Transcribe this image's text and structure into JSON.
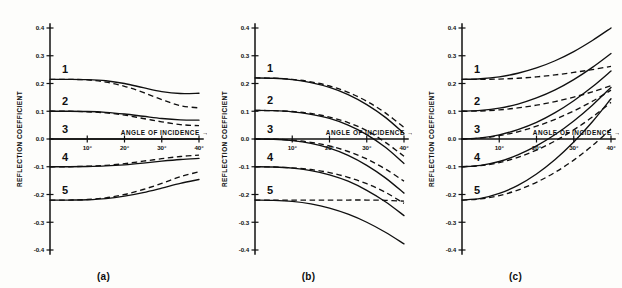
{
  "figure": {
    "panels": [
      {
        "caption": "(a)",
        "xlabel": "ANGLE OF INCIDENCE",
        "xlabel_arrow": "→",
        "ylabel": "REFLECTION COEFFICIENT",
        "curve_labels": [
          "1",
          "2",
          "3",
          "4",
          "5"
        ]
      },
      {
        "caption": "(b)",
        "xlabel": "ANGLE OF INCIDENCE",
        "xlabel_arrow": "→",
        "ylabel": "REFLECTION COEFFICIENT",
        "curve_labels": [
          "1",
          "2",
          "3",
          "4",
          "5"
        ]
      },
      {
        "caption": "(c)",
        "xlabel": "ANGLE OF INCIDENCE",
        "xlabel_arrow": "→",
        "ylabel": "REFLECTION COEFFICIENT",
        "curve_labels": [
          "1",
          "2",
          "3",
          "4",
          "5"
        ]
      }
    ],
    "yticks": [
      "0.4",
      "0.3",
      "0.2",
      "0.1",
      "0.0",
      "-0.1",
      "-0.2",
      "-0.3",
      "-0.4"
    ],
    "xticks": [
      "10°",
      "20°",
      "30°",
      "40°"
    ]
  },
  "chart_data": [
    {
      "type": "line",
      "title": "(a)",
      "xlabel": "ANGLE OF INCIDENCE",
      "ylabel": "REFLECTION COEFFICIENT",
      "xlim": [
        0,
        40
      ],
      "ylim": [
        -0.4,
        0.4
      ],
      "xticks": [
        10,
        20,
        30,
        40
      ],
      "yticks": [
        -0.4,
        -0.3,
        -0.2,
        -0.1,
        0.0,
        0.1,
        0.2,
        0.3,
        0.4
      ],
      "grid": false,
      "legend": "none",
      "x": [
        0,
        5,
        10,
        15,
        20,
        25,
        30,
        35,
        40
      ],
      "series": [
        {
          "name": "1 solid",
          "label": "1",
          "style": "solid",
          "values": [
            0.215,
            0.215,
            0.214,
            0.21,
            0.2,
            0.185,
            0.171,
            0.164,
            0.165
          ]
        },
        {
          "name": "1 dashed",
          "label": "1",
          "style": "dashed",
          "values": [
            0.215,
            0.215,
            0.213,
            0.205,
            0.19,
            0.168,
            0.142,
            0.12,
            0.112
          ]
        },
        {
          "name": "2 solid",
          "label": "2",
          "style": "solid",
          "values": [
            0.1,
            0.1,
            0.099,
            0.096,
            0.09,
            0.082,
            0.074,
            0.069,
            0.068
          ]
        },
        {
          "name": "2 dashed",
          "label": "2",
          "style": "dashed",
          "values": [
            0.1,
            0.1,
            0.098,
            0.094,
            0.086,
            0.074,
            0.062,
            0.052,
            0.048
          ]
        },
        {
          "name": "3 solid",
          "label": "3",
          "style": "solid",
          "values": [
            0.0,
            0.0,
            0.0,
            0.0,
            0.0,
            0.0,
            0.0,
            0.0,
            0.0
          ]
        },
        {
          "name": "4 solid",
          "label": "4",
          "style": "solid",
          "values": [
            -0.1,
            -0.1,
            -0.099,
            -0.097,
            -0.093,
            -0.087,
            -0.08,
            -0.074,
            -0.07
          ]
        },
        {
          "name": "4 dashed",
          "label": "4",
          "style": "dashed",
          "values": [
            -0.1,
            -0.1,
            -0.098,
            -0.095,
            -0.089,
            -0.08,
            -0.071,
            -0.063,
            -0.058
          ]
        },
        {
          "name": "5 solid",
          "label": "5",
          "style": "solid",
          "values": [
            -0.22,
            -0.22,
            -0.219,
            -0.215,
            -0.206,
            -0.193,
            -0.177,
            -0.16,
            -0.146
          ]
        },
        {
          "name": "5 dashed",
          "label": "5",
          "style": "dashed",
          "values": [
            -0.22,
            -0.22,
            -0.218,
            -0.212,
            -0.2,
            -0.182,
            -0.16,
            -0.136,
            -0.118
          ]
        }
      ]
    },
    {
      "type": "line",
      "title": "(b)",
      "xlabel": "ANGLE OF INCIDENCE",
      "ylabel": "REFLECTION COEFFICIENT",
      "xlim": [
        0,
        40
      ],
      "ylim": [
        -0.4,
        0.4
      ],
      "xticks": [
        10,
        20,
        30,
        40
      ],
      "yticks": [
        -0.4,
        -0.3,
        -0.2,
        -0.1,
        0.0,
        0.1,
        0.2,
        0.3,
        0.4
      ],
      "grid": false,
      "legend": "none",
      "x": [
        0,
        5,
        10,
        15,
        20,
        25,
        30,
        35,
        40
      ],
      "series": [
        {
          "name": "1 solid",
          "label": "1",
          "style": "solid",
          "values": [
            0.22,
            0.219,
            0.214,
            0.203,
            0.186,
            0.16,
            0.124,
            0.078,
            0.02
          ]
        },
        {
          "name": "1 dashed",
          "label": "1",
          "style": "dashed",
          "values": [
            0.22,
            0.219,
            0.215,
            0.206,
            0.191,
            0.168,
            0.136,
            0.094,
            0.042
          ]
        },
        {
          "name": "2 solid",
          "label": "2",
          "style": "solid",
          "values": [
            0.103,
            0.102,
            0.098,
            0.089,
            0.074,
            0.05,
            0.016,
            -0.03,
            -0.088
          ]
        },
        {
          "name": "2 dashed",
          "label": "2",
          "style": "dashed",
          "values": [
            0.103,
            0.102,
            0.099,
            0.092,
            0.079,
            0.059,
            0.03,
            -0.012,
            -0.062
          ]
        },
        {
          "name": "3 solid",
          "label": "3",
          "style": "solid",
          "values": [
            0.0,
            -0.001,
            -0.006,
            -0.016,
            -0.033,
            -0.059,
            -0.095,
            -0.14,
            -0.195
          ]
        },
        {
          "name": "3 dashed",
          "label": "3",
          "style": "dashed",
          "values": [
            0.0,
            -0.001,
            -0.004,
            -0.012,
            -0.025,
            -0.045,
            -0.072,
            -0.108,
            -0.152
          ]
        },
        {
          "name": "4 solid",
          "label": "4",
          "style": "solid",
          "values": [
            -0.1,
            -0.101,
            -0.105,
            -0.114,
            -0.129,
            -0.152,
            -0.185,
            -0.226,
            -0.276
          ]
        },
        {
          "name": "4 dashed",
          "label": "4",
          "style": "dashed",
          "values": [
            -0.1,
            -0.101,
            -0.104,
            -0.11,
            -0.121,
            -0.138,
            -0.161,
            -0.192,
            -0.232
          ]
        },
        {
          "name": "5 solid",
          "label": "5",
          "style": "solid",
          "values": [
            -0.22,
            -0.221,
            -0.225,
            -0.234,
            -0.249,
            -0.271,
            -0.3,
            -0.336,
            -0.378
          ]
        },
        {
          "name": "5 dashed",
          "label": "5",
          "style": "dashed",
          "values": [
            -0.22,
            -0.22,
            -0.22,
            -0.22,
            -0.22,
            -0.22,
            -0.22,
            -0.221,
            -0.224
          ]
        }
      ]
    },
    {
      "type": "line",
      "title": "(c)",
      "xlabel": "ANGLE OF INCIDENCE",
      "ylabel": "REFLECTION COEFFICIENT",
      "xlim": [
        0,
        40
      ],
      "ylim": [
        -0.4,
        0.4
      ],
      "xticks": [
        10,
        20,
        30,
        40
      ],
      "yticks": [
        -0.4,
        -0.3,
        -0.2,
        -0.1,
        0.0,
        0.1,
        0.2,
        0.3,
        0.4
      ],
      "grid": false,
      "legend": "none",
      "x": [
        0,
        5,
        10,
        15,
        20,
        25,
        30,
        35,
        40
      ],
      "series": [
        {
          "name": "1 solid",
          "label": "1",
          "style": "solid",
          "values": [
            0.215,
            0.217,
            0.224,
            0.237,
            0.256,
            0.282,
            0.315,
            0.355,
            0.4
          ]
        },
        {
          "name": "1 dashed",
          "label": "1",
          "style": "dashed",
          "values": [
            0.215,
            0.215,
            0.216,
            0.219,
            0.224,
            0.231,
            0.24,
            0.25,
            0.262
          ]
        },
        {
          "name": "2 solid",
          "label": "2",
          "style": "solid",
          "values": [
            0.1,
            0.103,
            0.111,
            0.126,
            0.148,
            0.177,
            0.214,
            0.258,
            0.308
          ]
        },
        {
          "name": "2 dashed",
          "label": "2",
          "style": "dashed",
          "values": [
            0.1,
            0.101,
            0.105,
            0.112,
            0.122,
            0.135,
            0.151,
            0.17,
            0.192
          ]
        },
        {
          "name": "3 solid",
          "label": "3",
          "style": "solid",
          "values": [
            0.0,
            0.004,
            0.015,
            0.034,
            0.06,
            0.095,
            0.138,
            0.188,
            0.245
          ]
        },
        {
          "name": "3 dashed",
          "label": "3",
          "style": "dashed",
          "values": [
            0.0,
            0.003,
            0.012,
            0.026,
            0.046,
            0.071,
            0.101,
            0.136,
            0.176
          ]
        },
        {
          "name": "4 solid",
          "label": "4",
          "style": "solid",
          "values": [
            -0.1,
            -0.095,
            -0.081,
            -0.057,
            -0.025,
            0.016,
            0.065,
            0.122,
            0.186
          ]
        },
        {
          "name": "4 dashed",
          "label": "4",
          "style": "dashed",
          "values": [
            -0.1,
            -0.096,
            -0.085,
            -0.066,
            -0.04,
            -0.007,
            0.033,
            0.079,
            0.132
          ]
        },
        {
          "name": "5 solid",
          "label": "5",
          "style": "solid",
          "values": [
            -0.22,
            -0.214,
            -0.196,
            -0.167,
            -0.126,
            -0.074,
            -0.011,
            0.062,
            0.145
          ]
        },
        {
          "name": "5 dashed",
          "label": "5",
          "style": "dashed",
          "values": [
            -0.22,
            -0.216,
            -0.204,
            -0.184,
            -0.156,
            -0.12,
            -0.076,
            -0.024,
            0.036
          ]
        }
      ]
    }
  ]
}
